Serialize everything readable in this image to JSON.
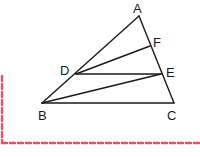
{
  "diagram": {
    "type": "geometry-triangle",
    "colors": {
      "line": "#1a1a1a",
      "label": "#1a1a1a",
      "border": "#e8506a"
    },
    "points": {
      "A": {
        "label": "A",
        "x": 139,
        "y": 16,
        "lx": 133,
        "ly": 13
      },
      "F": {
        "label": "F",
        "x": 150,
        "y": 46,
        "lx": 153,
        "ly": 47
      },
      "D": {
        "label": "D",
        "x": 76,
        "y": 74,
        "lx": 60,
        "ly": 75
      },
      "E": {
        "label": "E",
        "x": 161,
        "y": 74,
        "lx": 166,
        "ly": 77
      },
      "B": {
        "label": "B",
        "x": 42,
        "y": 103,
        "lx": 38,
        "ly": 120
      },
      "C": {
        "label": "C",
        "x": 174,
        "y": 103,
        "lx": 167,
        "ly": 120
      }
    },
    "segments": [
      [
        "A",
        "B"
      ],
      [
        "A",
        "C"
      ],
      [
        "B",
        "C"
      ],
      [
        "D",
        "F"
      ],
      [
        "D",
        "E"
      ],
      [
        "B",
        "E"
      ]
    ],
    "border": {
      "style": "dashed",
      "vertical": {
        "x": 2,
        "y1": 76,
        "y2": 143
      },
      "horizontal": {
        "y": 143,
        "x1": 2,
        "x2": 200
      }
    }
  }
}
